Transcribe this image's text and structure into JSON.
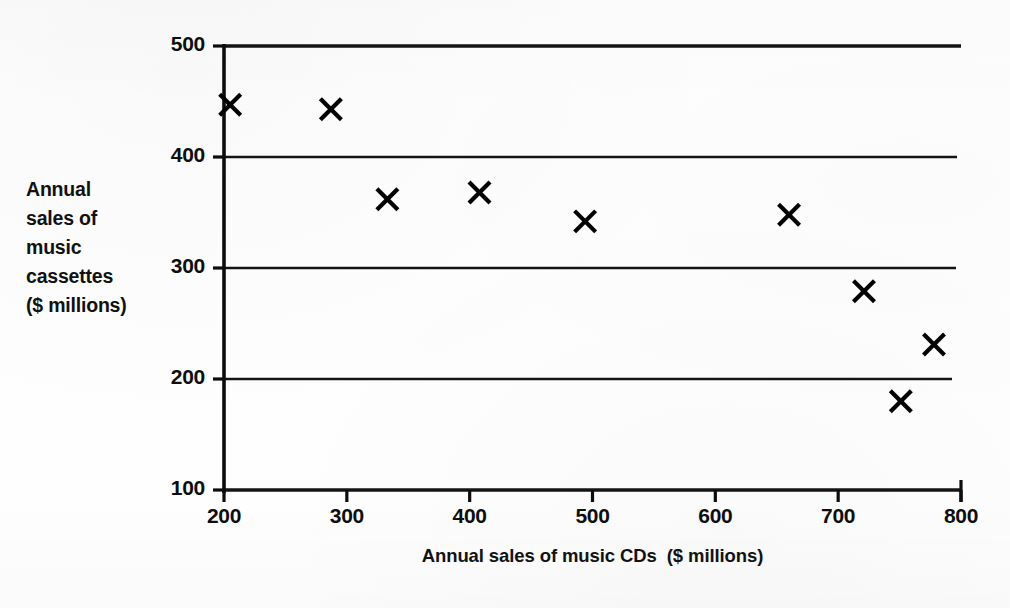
{
  "chart_data": {
    "type": "scatter",
    "title": "",
    "xlabel": "Annual sales of music CDs  ($ millions)",
    "ylabel": "Annual sales of music cassettes ($ millions)",
    "ylabel_lines": [
      "Annual",
      "sales of",
      "music",
      "cassettes",
      "($ millions)"
    ],
    "xlim": [
      200,
      800
    ],
    "ylim": [
      100,
      500
    ],
    "xticks": [
      200,
      300,
      400,
      500,
      600,
      700,
      800
    ],
    "yticks": [
      100,
      200,
      300,
      400,
      500
    ],
    "xtick_labels": [
      "200",
      "300",
      "400",
      "500",
      "600",
      "700",
      "800"
    ],
    "ytick_labels": [
      "100",
      "200",
      "300",
      "400",
      "500"
    ],
    "grid": "horizontal",
    "legend": "none",
    "marker": "x",
    "marker_color": "#000000",
    "points": [
      {
        "x": 205,
        "y": 447
      },
      {
        "x": 287,
        "y": 443
      },
      {
        "x": 333,
        "y": 362
      },
      {
        "x": 408,
        "y": 368
      },
      {
        "x": 494,
        "y": 342
      },
      {
        "x": 660,
        "y": 348
      },
      {
        "x": 721,
        "y": 279
      },
      {
        "x": 778,
        "y": 231
      },
      {
        "x": 751,
        "y": 180
      }
    ]
  },
  "axes": {
    "axis_color": "#0d0d0d",
    "grid_color": "#141414",
    "background": "#fefefe"
  }
}
